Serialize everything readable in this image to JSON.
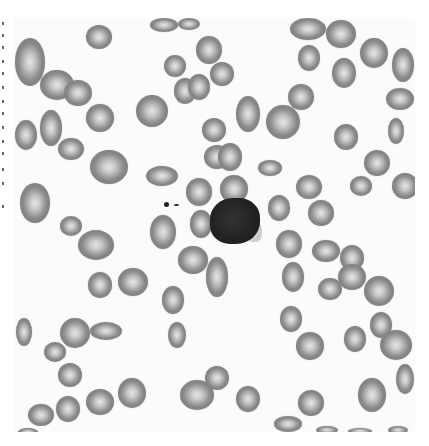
{
  "image": {
    "subject": "peripheral blood smear micrograph (grayscale)",
    "background_color": "#fbfbfb",
    "rbc_color": "#7f7f7f",
    "rbc_center_color": "#e6e6e6",
    "wbc_color": "#222222",
    "cells": [
      {
        "type": "rbc",
        "x": 86,
        "y": 25,
        "w": 26,
        "h": 24
      },
      {
        "type": "rbc",
        "x": 150,
        "y": 18,
        "w": 28,
        "h": 14
      },
      {
        "type": "rbc",
        "x": 178,
        "y": 18,
        "w": 22,
        "h": 12
      },
      {
        "type": "rbc",
        "x": 196,
        "y": 36,
        "w": 26,
        "h": 28
      },
      {
        "type": "rbc",
        "x": 164,
        "y": 55,
        "w": 22,
        "h": 22
      },
      {
        "type": "rbc",
        "x": 210,
        "y": 62,
        "w": 24,
        "h": 24
      },
      {
        "type": "rbc",
        "x": 174,
        "y": 78,
        "w": 22,
        "h": 26
      },
      {
        "type": "rbc",
        "x": 188,
        "y": 74,
        "w": 22,
        "h": 26
      },
      {
        "type": "rbc",
        "x": 15,
        "y": 38,
        "w": 30,
        "h": 48
      },
      {
        "type": "rbc",
        "x": 40,
        "y": 70,
        "w": 34,
        "h": 30
      },
      {
        "type": "rbc",
        "x": 64,
        "y": 80,
        "w": 28,
        "h": 26
      },
      {
        "type": "rbc",
        "x": 86,
        "y": 104,
        "w": 28,
        "h": 28
      },
      {
        "type": "rbc",
        "x": 136,
        "y": 95,
        "w": 32,
        "h": 32
      },
      {
        "type": "rbc",
        "x": 40,
        "y": 110,
        "w": 22,
        "h": 36
      },
      {
        "type": "rbc",
        "x": 15,
        "y": 120,
        "w": 22,
        "h": 30
      },
      {
        "type": "rbc",
        "x": 58,
        "y": 138,
        "w": 26,
        "h": 22
      },
      {
        "type": "rbc",
        "x": 90,
        "y": 150,
        "w": 38,
        "h": 34
      },
      {
        "type": "rbc",
        "x": 146,
        "y": 166,
        "w": 32,
        "h": 20
      },
      {
        "type": "rbc",
        "x": 20,
        "y": 183,
        "w": 30,
        "h": 40
      },
      {
        "type": "rbc",
        "x": 60,
        "y": 216,
        "w": 22,
        "h": 20
      },
      {
        "type": "rbc",
        "x": 78,
        "y": 230,
        "w": 36,
        "h": 30
      },
      {
        "type": "rbc",
        "x": 186,
        "y": 178,
        "w": 26,
        "h": 28
      },
      {
        "type": "rbc",
        "x": 190,
        "y": 210,
        "w": 22,
        "h": 28
      },
      {
        "type": "rbc",
        "x": 204,
        "y": 145,
        "w": 26,
        "h": 24
      },
      {
        "type": "rbc",
        "x": 218,
        "y": 143,
        "w": 24,
        "h": 28
      },
      {
        "type": "rbc",
        "x": 220,
        "y": 175,
        "w": 28,
        "h": 28
      },
      {
        "type": "rbc",
        "x": 202,
        "y": 118,
        "w": 24,
        "h": 24
      },
      {
        "type": "rbc",
        "x": 236,
        "y": 96,
        "w": 24,
        "h": 36
      },
      {
        "type": "rbc",
        "x": 266,
        "y": 105,
        "w": 34,
        "h": 34
      },
      {
        "type": "rbc",
        "x": 258,
        "y": 160,
        "w": 24,
        "h": 16
      },
      {
        "type": "rbc",
        "x": 288,
        "y": 84,
        "w": 26,
        "h": 26
      },
      {
        "type": "rbc",
        "x": 290,
        "y": 18,
        "w": 36,
        "h": 22
      },
      {
        "type": "rbc",
        "x": 298,
        "y": 45,
        "w": 22,
        "h": 26
      },
      {
        "type": "rbc",
        "x": 326,
        "y": 20,
        "w": 30,
        "h": 28
      },
      {
        "type": "rbc",
        "x": 332,
        "y": 58,
        "w": 24,
        "h": 30
      },
      {
        "type": "rbc",
        "x": 360,
        "y": 38,
        "w": 28,
        "h": 30
      },
      {
        "type": "rbc",
        "x": 392,
        "y": 48,
        "w": 22,
        "h": 34
      },
      {
        "type": "rbc",
        "x": 386,
        "y": 88,
        "w": 28,
        "h": 22
      },
      {
        "type": "rbc",
        "x": 334,
        "y": 124,
        "w": 24,
        "h": 26
      },
      {
        "type": "rbc",
        "x": 388,
        "y": 118,
        "w": 16,
        "h": 26
      },
      {
        "type": "rbc",
        "x": 364,
        "y": 150,
        "w": 26,
        "h": 26
      },
      {
        "type": "rbc",
        "x": 350,
        "y": 176,
        "w": 22,
        "h": 20
      },
      {
        "type": "rbc",
        "x": 392,
        "y": 173,
        "w": 26,
        "h": 26
      },
      {
        "type": "rbc",
        "x": 296,
        "y": 175,
        "w": 26,
        "h": 24
      },
      {
        "type": "rbc",
        "x": 268,
        "y": 195,
        "w": 22,
        "h": 26
      },
      {
        "type": "rbc",
        "x": 308,
        "y": 200,
        "w": 26,
        "h": 26
      },
      {
        "type": "rbc",
        "x": 276,
        "y": 230,
        "w": 26,
        "h": 28
      },
      {
        "type": "rbc",
        "x": 312,
        "y": 240,
        "w": 28,
        "h": 22
      },
      {
        "type": "rbc",
        "x": 340,
        "y": 245,
        "w": 24,
        "h": 26
      },
      {
        "type": "rbc",
        "x": 338,
        "y": 264,
        "w": 28,
        "h": 26
      },
      {
        "type": "rbc",
        "x": 364,
        "y": 276,
        "w": 30,
        "h": 30
      },
      {
        "type": "rbc",
        "x": 282,
        "y": 262,
        "w": 22,
        "h": 30
      },
      {
        "type": "rbc",
        "x": 318,
        "y": 278,
        "w": 24,
        "h": 22
      },
      {
        "type": "rbc",
        "x": 206,
        "y": 257,
        "w": 22,
        "h": 40
      },
      {
        "type": "rbc",
        "x": 178,
        "y": 246,
        "w": 30,
        "h": 28
      },
      {
        "type": "rbc",
        "x": 150,
        "y": 215,
        "w": 26,
        "h": 34
      },
      {
        "type": "rbc",
        "x": 88,
        "y": 272,
        "w": 24,
        "h": 26
      },
      {
        "type": "rbc",
        "x": 118,
        "y": 268,
        "w": 30,
        "h": 28
      },
      {
        "type": "rbc",
        "x": 162,
        "y": 286,
        "w": 22,
        "h": 28
      },
      {
        "type": "rbc",
        "x": 16,
        "y": 318,
        "w": 16,
        "h": 28
      },
      {
        "type": "rbc",
        "x": 60,
        "y": 318,
        "w": 30,
        "h": 30
      },
      {
        "type": "rbc",
        "x": 90,
        "y": 322,
        "w": 32,
        "h": 18
      },
      {
        "type": "rbc",
        "x": 44,
        "y": 342,
        "w": 22,
        "h": 20
      },
      {
        "type": "rbc",
        "x": 168,
        "y": 322,
        "w": 18,
        "h": 26
      },
      {
        "type": "rbc",
        "x": 58,
        "y": 363,
        "w": 24,
        "h": 24
      },
      {
        "type": "rbc",
        "x": 118,
        "y": 378,
        "w": 28,
        "h": 30
      },
      {
        "type": "rbc",
        "x": 86,
        "y": 389,
        "w": 28,
        "h": 26
      },
      {
        "type": "rbc",
        "x": 56,
        "y": 396,
        "w": 24,
        "h": 26
      },
      {
        "type": "rbc",
        "x": 28,
        "y": 404,
        "w": 26,
        "h": 22
      },
      {
        "type": "rbc",
        "x": 18,
        "y": 428,
        "w": 20,
        "h": 8
      },
      {
        "type": "rbc",
        "x": 180,
        "y": 380,
        "w": 34,
        "h": 30
      },
      {
        "type": "rbc",
        "x": 205,
        "y": 366,
        "w": 24,
        "h": 24
      },
      {
        "type": "rbc",
        "x": 236,
        "y": 386,
        "w": 24,
        "h": 26
      },
      {
        "type": "rbc",
        "x": 280,
        "y": 306,
        "w": 22,
        "h": 26
      },
      {
        "type": "rbc",
        "x": 296,
        "y": 332,
        "w": 28,
        "h": 28
      },
      {
        "type": "rbc",
        "x": 344,
        "y": 326,
        "w": 22,
        "h": 26
      },
      {
        "type": "rbc",
        "x": 370,
        "y": 312,
        "w": 22,
        "h": 26
      },
      {
        "type": "rbc",
        "x": 380,
        "y": 330,
        "w": 32,
        "h": 30
      },
      {
        "type": "rbc",
        "x": 396,
        "y": 364,
        "w": 18,
        "h": 30
      },
      {
        "type": "rbc",
        "x": 358,
        "y": 378,
        "w": 28,
        "h": 34
      },
      {
        "type": "rbc",
        "x": 298,
        "y": 390,
        "w": 26,
        "h": 26
      },
      {
        "type": "rbc",
        "x": 274,
        "y": 416,
        "w": 28,
        "h": 16
      },
      {
        "type": "rbc",
        "x": 316,
        "y": 426,
        "w": 22,
        "h": 8
      },
      {
        "type": "rbc",
        "x": 348,
        "y": 428,
        "w": 24,
        "h": 6
      },
      {
        "type": "rbc",
        "x": 388,
        "y": 426,
        "w": 20,
        "h": 8
      }
    ],
    "wbc": {
      "x": 210,
      "y": 198,
      "w": 50,
      "h": 46
    },
    "specks": [
      {
        "x": 164,
        "y": 202,
        "w": 5,
        "h": 5
      },
      {
        "x": 174,
        "y": 204,
        "w": 5,
        "h": 2
      }
    ]
  }
}
